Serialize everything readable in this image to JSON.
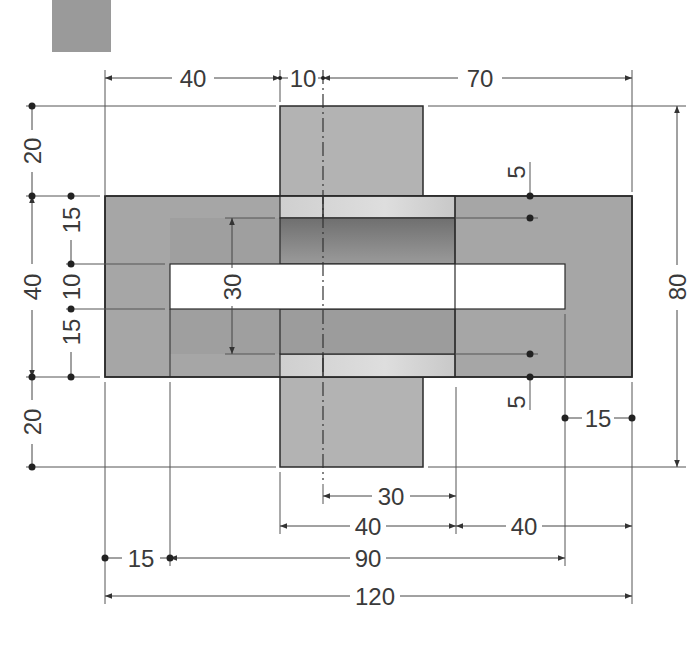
{
  "swatch": {
    "color": "#9a9a9a",
    "x": 52,
    "y": 0,
    "w": 59,
    "h": 52
  },
  "colors": {
    "plate": "#a6a6a6",
    "plate_inner": "#9e9e9e",
    "post": "#b3b3b3",
    "strip_light": "#d6d6d6",
    "bar_dark": "#7f7f7f",
    "slot": "#ffffff",
    "line": "#2a2a2a",
    "dim_line": "#555555",
    "text": "#3a3a3a"
  },
  "geometry": {
    "plate": {
      "x1": 105,
      "y1": 196,
      "x2": 632,
      "y2": 377
    },
    "post": {
      "x1": 280,
      "y1": 106,
      "x2": 423,
      "y2": 467
    },
    "slot": {
      "x1": 170,
      "y1": 264,
      "x2": 565,
      "y2": 309
    },
    "upper_bar": {
      "x1": 280,
      "y1": 218,
      "x2": 455,
      "y2": 264
    },
    "lower_bar": {
      "x1": 280,
      "y1": 309,
      "x2": 455,
      "y2": 354
    },
    "upper_strip": {
      "x1": 280,
      "y1": 196,
      "x2": 455,
      "y2": 218
    },
    "lower_strip": {
      "x1": 280,
      "y1": 354,
      "x2": 455,
      "y2": 377
    },
    "centerline_x": 323
  },
  "dimensions": {
    "top": [
      {
        "label": "40",
        "x": 193,
        "y": 80
      },
      {
        "label": "10",
        "x": 303,
        "y": 80
      },
      {
        "label": "70",
        "x": 480,
        "y": 80
      }
    ],
    "left_outer": [
      {
        "label": "20",
        "x": 32,
        "y": 151
      },
      {
        "label": "40",
        "x": 32,
        "y": 287
      },
      {
        "label": "20",
        "x": 32,
        "y": 422
      }
    ],
    "left_inner": [
      {
        "label": "15",
        "x": 71,
        "y": 219
      },
      {
        "label": "10",
        "x": 71,
        "y": 287
      },
      {
        "label": "15",
        "x": 71,
        "y": 332
      }
    ],
    "inner_height": {
      "label": "30",
      "x": 232,
      "y": 287
    },
    "right_height": {
      "label": "80",
      "x": 677,
      "y": 287
    },
    "right_small": [
      {
        "label": "5",
        "x": 517,
        "y": 172
      },
      {
        "label": "5",
        "x": 517,
        "y": 402
      }
    ],
    "right_15": {
      "label": "15",
      "x": 598,
      "y": 418
    },
    "bottom": [
      {
        "label": "30",
        "x": 390,
        "y": 496
      },
      {
        "label": "40",
        "x": 367,
        "y": 526
      },
      {
        "label": "40",
        "x": 523,
        "y": 526
      },
      {
        "label": "15",
        "x": 141,
        "y": 558
      },
      {
        "label": "90",
        "x": 368,
        "y": 558
      },
      {
        "label": "120",
        "x": 373,
        "y": 596
      }
    ]
  }
}
